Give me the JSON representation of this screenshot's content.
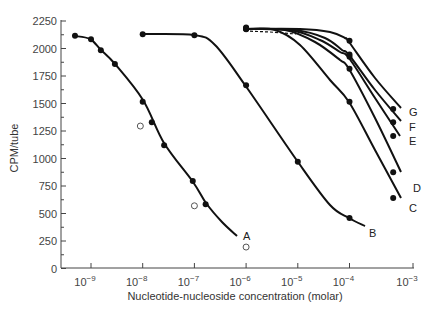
{
  "chart_data": {
    "type": "line",
    "title": "",
    "xlabel": "Nucleotide-nucleoside concentration (molar)",
    "ylabel": "CPM/tube",
    "xscale": "log",
    "xlim": [
      3e-10,
      0.001
    ],
    "ylim": [
      0,
      2250
    ],
    "x_ticks": [
      "10^-9",
      "10^-8",
      "10^-7",
      "10^-6",
      "10^-5",
      "10^-4",
      "10^-3"
    ],
    "y_ticks": [
      0,
      250,
      500,
      750,
      1000,
      1250,
      1500,
      1750,
      2000,
      2250
    ],
    "grid": false,
    "legend": "inline curve labels",
    "series": [
      {
        "name": "A",
        "marker": "filled",
        "x": [
          4.9e-10,
          1e-09,
          1.55e-09,
          2.9e-09,
          1e-08,
          1.5e-08,
          2.6e-08,
          9.3e-08,
          1.65e-07
        ],
        "y": [
          2115,
          2085,
          1985,
          1860,
          1515,
          1330,
          1120,
          795,
          585
        ],
        "curve_end": [
          6.5e-07,
          290
        ]
      },
      {
        "name": "A (open circles)",
        "marker": "open",
        "x": [
          9e-09,
          1e-07,
          1e-06
        ],
        "y": [
          1295,
          570,
          195
        ]
      },
      {
        "name": "B",
        "marker": "filled",
        "x": [
          1e-08,
          1e-07,
          1e-06,
          1e-05,
          0.0001
        ],
        "y": [
          2130,
          2120,
          1665,
          970,
          460
        ],
        "curve_end": [
          0.00028,
          385
        ]
      },
      {
        "name": "C",
        "marker": "filled",
        "x": [
          1e-06,
          0.0001,
          0.0007
        ],
        "y": [
          2175,
          1515,
          640
        ]
      },
      {
        "name": "D",
        "marker": "filled",
        "x": [
          1e-06,
          0.0001,
          0.0007
        ],
        "y": [
          2180,
          1815,
          875
        ]
      },
      {
        "name": "E",
        "marker": "filled",
        "x": [
          1e-06,
          0.0001,
          0.0007
        ],
        "y": [
          2180,
          1925,
          1205
        ]
      },
      {
        "name": "F",
        "marker": "filled",
        "x": [
          1e-06,
          0.0001,
          0.0007
        ],
        "y": [
          2185,
          1945,
          1330
        ]
      },
      {
        "name": "G",
        "marker": "filled",
        "x": [
          1e-06,
          0.0001,
          0.0007
        ],
        "y": [
          2190,
          2070,
          1450
        ]
      }
    ],
    "annotations": [
      "dashed line from 10^-6 to ~10^-5 near 2150 (baseline for curves C-G)"
    ]
  },
  "labels": {
    "ylabel": "CPM/tube",
    "xlabel": "Nucleotide-nucleoside concentration (molar)"
  }
}
